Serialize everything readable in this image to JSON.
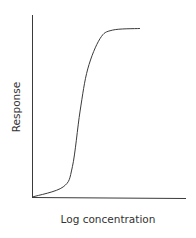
{
  "chart_data": {
    "type": "line",
    "title": "",
    "xlabel": "Log concentration",
    "ylabel": "Response",
    "grid": false,
    "legend": null,
    "ticks": {
      "x": [],
      "y": []
    },
    "series": [
      {
        "name": "Dose-response",
        "x": [
          0,
          0.2,
          0.26,
          0.31,
          0.36,
          0.44,
          0.52,
          0.7
        ],
        "y": [
          0,
          0.06,
          0.18,
          0.51,
          0.76,
          0.94,
          0.99,
          1.0
        ]
      }
    ],
    "xlim": [
      0,
      1
    ],
    "ylim": [
      0,
      1.08
    ]
  },
  "axes": {
    "x_label": "Log concentration",
    "y_label": "Response"
  }
}
